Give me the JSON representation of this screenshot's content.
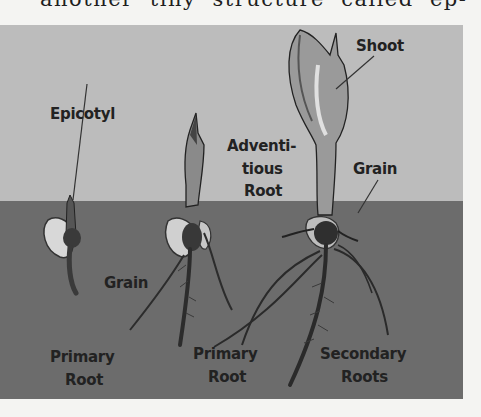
{
  "page": {
    "top_text": "another tiny structure called ep-"
  },
  "figure": {
    "colors": {
      "sky": "#bcbcbc",
      "soil": "#6c6c6c",
      "page": "#f4f4f2",
      "ink": "#222222"
    },
    "labels": {
      "epicotyl": "Epicotyl",
      "shoot": "Shoot",
      "adventitious_root_1": "Adventi-",
      "adventitious_root_2": "tious",
      "adventitious_root_3": "Root",
      "grain_right": "Grain",
      "grain_left": "Grain",
      "primary_root_left_1": "Primary",
      "primary_root_left_2": "Root",
      "primary_root_mid_1": "Primary",
      "primary_root_mid_2": "Root",
      "secondary_roots_1": "Secondary",
      "secondary_roots_2": "Roots"
    },
    "stages": [
      "early seedling",
      "middle seedling",
      "mature seedling"
    ]
  }
}
